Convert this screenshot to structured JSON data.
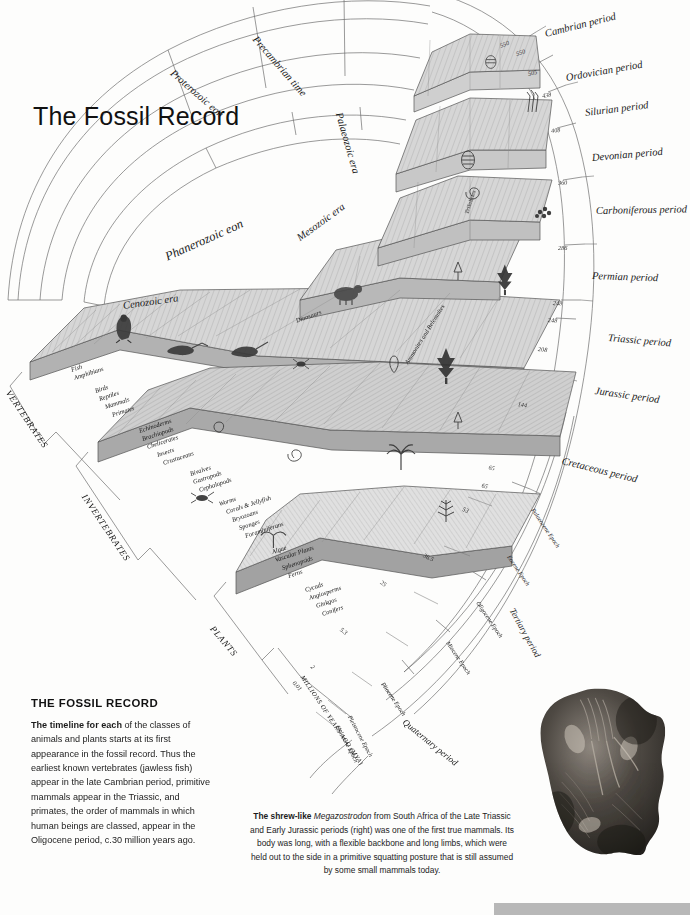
{
  "title": "The Fossil Record",
  "eons": [
    {
      "name": "Proterozoic eon"
    },
    {
      "name": "Precambrian time"
    },
    {
      "name": "Phanerozoic eon"
    }
  ],
  "eras": [
    {
      "name": "Palaeozoic era"
    },
    {
      "name": "Mesozoic era"
    },
    {
      "name": "Cenozoic era"
    }
  ],
  "periods": [
    {
      "name": "Cambrian period",
      "start": "550"
    },
    {
      "name": "Ordovician period",
      "start": "505"
    },
    {
      "name": "Silurian period",
      "start": "438"
    },
    {
      "name": "Devonian period",
      "start": "408"
    },
    {
      "name": "Carboniferous period",
      "start": "360"
    },
    {
      "name": "Permian period",
      "start": "286"
    },
    {
      "name": "Triassic period",
      "start": "248"
    },
    {
      "name": "Jurassic period",
      "start": "208"
    },
    {
      "name": "Cretaceous period",
      "start": "144"
    },
    {
      "name": "Tertiary period",
      "start": "65"
    },
    {
      "name": "Quaternary period",
      "start": "2"
    }
  ],
  "boundary_values": [
    "550",
    "550",
    "505",
    "438",
    "408",
    "360",
    "286",
    "248",
    "248",
    "208",
    "144",
    "65",
    "65",
    "53",
    "36.5",
    "25",
    "5.3",
    "2",
    "0.01"
  ],
  "epochs": [
    {
      "name": "Palaeocene Epoch",
      "start": "65"
    },
    {
      "name": "Eocene Epoch",
      "start": "53"
    },
    {
      "name": "Oligocene Epoch",
      "start": "36.5"
    },
    {
      "name": "Miocene Epoch",
      "start": "25"
    },
    {
      "name": "Pliocene Epoch",
      "start": "5.3"
    },
    {
      "name": "Pleistocene Epoch",
      "start": "2"
    },
    {
      "name": "Holocene Epoch",
      "start": "0.01"
    }
  ],
  "axis_label": "MILLIONS OF YEARS AGO (MYA)",
  "groups": [
    {
      "name": "VERTEBRATES"
    },
    {
      "name": "INVERTEBRATES"
    },
    {
      "name": "PLANTS"
    }
  ],
  "vertebrates": [
    "Fish",
    "Amphibians",
    "Birds",
    "Reptiles",
    "Mammals",
    "Primates"
  ],
  "invertebrates": [
    "Echinoderms",
    "Brachiopods",
    "Chelicerates",
    "Insects",
    "Crustaceans",
    "Bivalves",
    "Gastropods",
    "Cephalopods",
    "Worms",
    "Corals & Jellyfish",
    "Bryozoans",
    "Sponges",
    "Foraminiferans"
  ],
  "plants": [
    "Algae",
    "Vascular Plants",
    "Sphenopsids",
    "Ferns",
    "Cycads",
    "Angiosperms",
    "Ginkgos",
    "Conifers"
  ],
  "block_labels": [
    "Dinosaurs",
    "Ammonites and Belemnites",
    "Trilobites"
  ],
  "caption": {
    "heading": "THE FOSSIL RECORD",
    "lead": "The timeline for each",
    "body": " of the classes of animals and plants starts at its first appearance in the fossil record. Thus the earliest known vertebrates (jawless fish) appear in the late Cambrian period, primitive mammals appear in the Triassic, and primates, the order of mammals in which human beings are classed, appear in the Oligocene period, c.30 million years ago."
  },
  "photo_caption": {
    "lead": "The shrew-like ",
    "genus": "Megazostrodon",
    "body": " from South Africa of the Late Triassic and Early Jurassic periods (right) was one of the first true mammals. Its body was long, with a flexible backbone and long limbs, which were held out to the side in a primitive squatting posture that is still assumed by some small mammals today."
  },
  "colors": {
    "page": "#fdfdfc",
    "ink": "#111111",
    "block_top": "#d9d9d9",
    "block_side": "#9b9b9b",
    "block_face": "#c2c2c2",
    "bottom_bar": "#b8b8b8"
  }
}
